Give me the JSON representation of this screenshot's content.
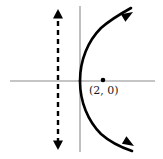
{
  "figure": {
    "kind": "parabola-with-directrix",
    "width": 163,
    "height": 159,
    "background": "#ffffff"
  },
  "colors": {
    "axis": "#8c8c8c",
    "curve": "#000000",
    "directrix": "#000000",
    "point": "#000000",
    "label_text": "#1a1a1a"
  },
  "axes": {
    "x_axis": {
      "name": "x-axis",
      "x1": 10,
      "y1": 81,
      "x2": 155,
      "y2": 81,
      "stroke_width": 1.1
    },
    "y_axis": {
      "name": "y-axis",
      "x1": 80,
      "y1": 6,
      "x2": 80,
      "y2": 152,
      "stroke_width": 1.1
    },
    "origin": {
      "x": 80,
      "y": 81
    }
  },
  "curve": {
    "name": "parabola",
    "opens": "right",
    "vertex": {
      "x": 80,
      "y": 81
    },
    "stroke_width": 2.6,
    "upper_branch_path": "M 80 81 C 80 60 88 41 101 28 C 110 20 122 13 131 8",
    "lower_branch_path": "M 80 81 C 80 102 88 121 101 134 C 110 142 123 148 132 151",
    "arrowheads": [
      {
        "name": "upper-arrowhead",
        "tip_x": 133,
        "tip_y": 12,
        "angle_deg": -31
      },
      {
        "name": "lower-arrowhead",
        "tip_x": 134,
        "tip_y": 146,
        "angle_deg": 31
      }
    ]
  },
  "directrix": {
    "name": "directrix-dashed-line",
    "x": 58,
    "y_top": 12,
    "y_bottom": 147,
    "stroke_width": 2.4,
    "dash_pattern": "5,4",
    "double_arrow": true,
    "arrowheads": [
      {
        "name": "directrix-up-arrowhead",
        "tip_x": 58,
        "tip_y": 9
      },
      {
        "name": "directrix-down-arrowhead",
        "tip_x": 58,
        "tip_y": 150
      }
    ]
  },
  "focus": {
    "name": "focus-point",
    "x": 103,
    "y": 80,
    "radius": 2.3,
    "label": "(2, 0)",
    "label_x": 89,
    "label_y": 85
  }
}
